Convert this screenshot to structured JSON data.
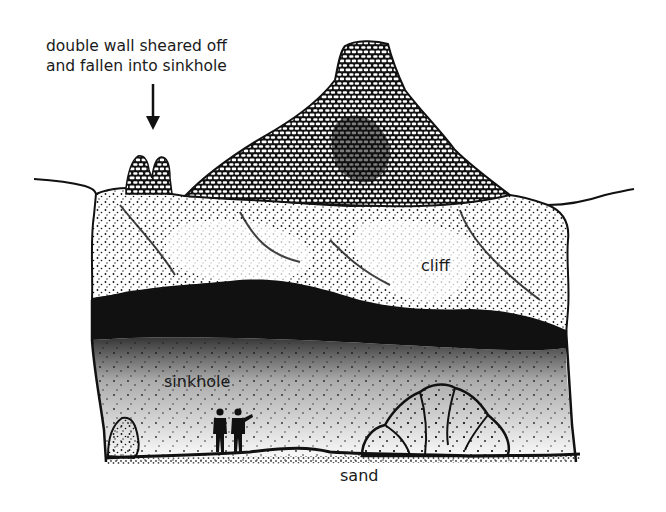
{
  "diagram": {
    "type": "cross-section illustration",
    "colors": {
      "ink": "#111111",
      "background": "#ffffff",
      "text": "#1a1a1a"
    },
    "annotations": {
      "caption_line1": "double wall sheared off",
      "caption_line2": "and fallen into sinkhole",
      "arrow": "down-arrow"
    },
    "labels": {
      "cliff": "cliff",
      "sinkhole": "sinkhole",
      "sand": "sand"
    },
    "figures": {
      "people_count": 2
    }
  }
}
